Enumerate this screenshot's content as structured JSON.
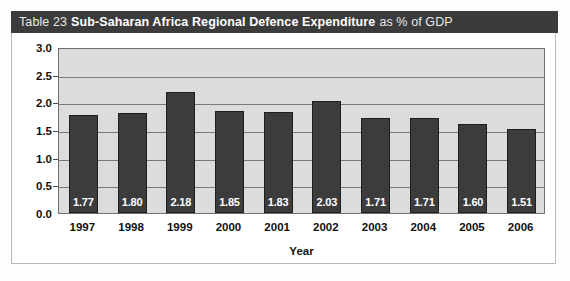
{
  "header": {
    "table_number": "Table 23",
    "title_bold": "Sub-Saharan Africa Regional Defence Expenditure",
    "title_suffix": "as % of GDP",
    "background_color": "#3b3b3b",
    "text_color": "#ffffff"
  },
  "chart_data": {
    "type": "bar",
    "title": "Sub-Saharan Africa Regional Defence Expenditure as % of GDP",
    "categories": [
      "1997",
      "1998",
      "1999",
      "2000",
      "2001",
      "2002",
      "2003",
      "2004",
      "2005",
      "2006"
    ],
    "values": [
      1.77,
      1.8,
      2.18,
      1.85,
      1.83,
      2.03,
      1.71,
      1.71,
      1.6,
      1.51
    ],
    "value_labels": [
      "1.77",
      "1.80",
      "2.18",
      "1.85",
      "1.83",
      "2.03",
      "1.71",
      "1.71",
      "1.60",
      "1.51"
    ],
    "xlabel": "Year",
    "ylabel": "% of GDP",
    "ylim": [
      0.0,
      3.0
    ],
    "ytick_values": [
      0.0,
      0.5,
      1.0,
      1.5,
      2.0,
      2.5,
      3.0
    ],
    "ytick_labels": [
      "0.0",
      "0.5",
      "1.0",
      "1.5",
      "2.0",
      "2.5",
      "3.0"
    ],
    "grid": true,
    "legend": "none",
    "bar_color": "#3c3c3c",
    "plot_background_color": "#dcdcdc",
    "gridline_color": "#7a7a7a"
  }
}
